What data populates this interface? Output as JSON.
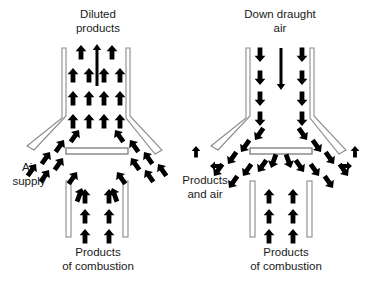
{
  "figure": {
    "title_visible": false,
    "background_color": "#ffffff",
    "ink_color": "#000000",
    "wall_fill": "#ffffff",
    "wall_stroke": "#8c8c8c",
    "panels": 2
  },
  "labels": {
    "left_top": "Diluted\nproducts",
    "left_side": "Air\nsupply",
    "left_bottom": "Products\nof combustion",
    "right_top": "Down draught\nair",
    "right_side": "Products\nand air",
    "right_bottom": "Products\nof combustion"
  },
  "panels": [
    {
      "id": "normal-draught",
      "name": "left-diagram",
      "top_label": "Diluted\nproducts",
      "side_label": "Air\nsupply",
      "bottom_label": "Products\nof combustion",
      "flow": {
        "flue_direction": "up",
        "centre_arrow": "up",
        "entrained_air": "inward-up",
        "combustion_products": "up"
      }
    },
    {
      "id": "down-draught",
      "name": "right-diagram",
      "top_label": "Down draught\nair",
      "side_label": "Products\nand air",
      "bottom_label": "Products\nof combustion",
      "flow": {
        "flue_direction": "down",
        "centre_arrow": "down",
        "entrained_air": "outward-down",
        "spillage": "out-sideways",
        "combustion_products": "up"
      }
    }
  ],
  "icons": {
    "arrow_up": "arrow-up-icon",
    "arrow_down": "arrow-down-icon",
    "arrow_diagonal": "arrow-diagonal-icon",
    "arrow_left": "arrow-left-icon",
    "arrow_right": "arrow-right-icon"
  }
}
